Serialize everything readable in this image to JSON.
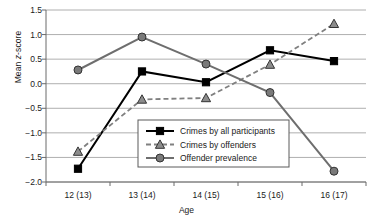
{
  "chart_data": {
    "type": "line",
    "title": "",
    "xlabel": "Age",
    "ylabel": "Mean z-score",
    "categories": [
      "12 (13)",
      "13 (14)",
      "14 (15)",
      "15 (16)",
      "16 (17)"
    ],
    "ylim": [
      -2.0,
      1.5
    ],
    "yticks": [
      "1.5",
      "1.0",
      "0.5",
      "0.0",
      "-0.5",
      "-1.0",
      "-1.5",
      "-2.0"
    ],
    "ytick_values": [
      1.5,
      1.0,
      0.5,
      0.0,
      -0.5,
      -1.0,
      -1.5,
      -2.0
    ],
    "grid": true,
    "legend_position": "center-bottom-inside",
    "series": [
      {
        "name": "Crimes by all participants",
        "values": [
          -1.73,
          0.25,
          0.03,
          0.68,
          0.46
        ],
        "marker": "square",
        "line_style": "solid",
        "color": "#000000",
        "marker_fill": "#000000"
      },
      {
        "name": "Crimes by offenders",
        "values": [
          -1.38,
          -0.32,
          -0.29,
          0.39,
          1.22
        ],
        "marker": "triangle",
        "line_style": "dashed",
        "color": "#808080",
        "marker_fill": "#8c8c8c"
      },
      {
        "name": "Offender prevalence",
        "values": [
          0.28,
          0.95,
          0.4,
          -0.18,
          -1.78
        ],
        "marker": "circle",
        "line_style": "solid",
        "color": "#6e6e6e",
        "marker_fill": "#7a7a7a"
      }
    ]
  },
  "legend": {
    "items": [
      {
        "label": "Crimes by all participants"
      },
      {
        "label": "Crimes by offenders"
      },
      {
        "label": "Offender prevalence"
      }
    ]
  },
  "axes": {
    "y_label_prefix": "Mean ",
    "y_label_italic": "z",
    "y_label_suffix": "-score",
    "x_label": "Age"
  }
}
